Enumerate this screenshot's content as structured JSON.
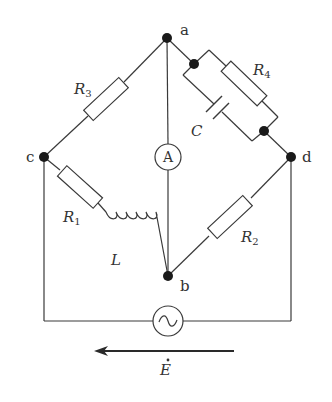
{
  "diagram": {
    "type": "AC bridge circuit",
    "nodes": {
      "a": "a",
      "b": "b",
      "c": "c",
      "d": "d"
    },
    "components": {
      "R3": {
        "symbol": "R",
        "sub": "3",
        "branch": "c-a",
        "kind": "resistor"
      },
      "R4": {
        "symbol": "R",
        "sub": "4",
        "branch": "a-d",
        "kind": "resistor",
        "parallel_with": "C"
      },
      "C": {
        "symbol": "C",
        "branch": "a-d",
        "kind": "capacitor"
      },
      "R1": {
        "symbol": "R",
        "sub": "1",
        "branch": "c-b",
        "kind": "resistor"
      },
      "L": {
        "symbol": "L",
        "branch": "c-b",
        "kind": "inductor"
      },
      "R2": {
        "symbol": "R",
        "sub": "2",
        "branch": "b-d",
        "kind": "resistor"
      },
      "ammeter": {
        "symbol": "A",
        "branch": "a-b",
        "kind": "ammeter"
      },
      "source": {
        "symbol": "~",
        "branch": "c-d",
        "kind": "AC voltage source"
      }
    },
    "source_label": "E",
    "source_label_accent": "·",
    "arrow_direction": "right-to-left",
    "colors": {
      "line": "#3a3a3a",
      "node": "#1a1a1a",
      "background": "#ffffff"
    }
  }
}
